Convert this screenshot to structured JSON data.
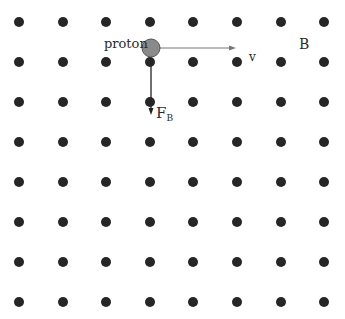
{
  "diagram": {
    "field_label": "B",
    "field_direction": "out-of-page",
    "particle_label": "proton",
    "velocity_label": "v",
    "force_label": "F",
    "force_subscript": "B",
    "grid": {
      "columns_x": [
        19,
        63,
        106,
        150,
        193,
        237,
        281,
        324
      ],
      "rows_y": [
        22,
        62,
        102,
        142,
        182,
        222,
        262,
        302
      ],
      "dot_radius": 5,
      "dot_color": "#262626"
    },
    "proton": {
      "cx": 151,
      "cy": 48,
      "r": 9,
      "fill": "#8a8a8a",
      "stroke": "#555555"
    },
    "velocity_arrow": {
      "x1": 160,
      "y1": 48,
      "x2": 236,
      "y2": 48,
      "color": "#777777"
    },
    "force_arrow": {
      "x1": 151,
      "y1": 57,
      "x2": 151,
      "y2": 115,
      "color": "#222222"
    }
  }
}
